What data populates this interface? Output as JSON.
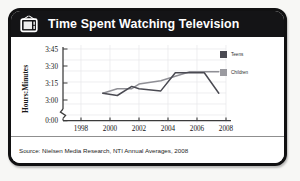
{
  "card": {
    "title": "Time Spent Watching Television",
    "icon": "television-icon",
    "source": "Source: Nielsen Media Research, NTI Annual Averages, 2008",
    "border_color": "#141416",
    "header_bg": "#141416",
    "body_bg": "#ffffff"
  },
  "chart_data": {
    "type": "line",
    "title": "Time Spent Watching Television",
    "xlabel": "",
    "ylabel": "Hours:Minutes",
    "xlim": [
      1998,
      2008
    ],
    "ylim": [
      180,
      225
    ],
    "xticks": [
      "1998",
      "2000",
      "2002",
      "2004",
      "2006",
      "2008"
    ],
    "xtick_values": [
      1998,
      2000,
      2002,
      2004,
      2006,
      2008
    ],
    "yticks": [
      "0:00",
      "3:00",
      "3:15",
      "3:30",
      "3:45"
    ],
    "ytick_values": [
      0,
      180,
      195,
      210,
      225
    ],
    "axis_break": true,
    "grid": true,
    "legend_position": "right",
    "series": [
      {
        "name": "Teens",
        "color": "#4a4a52",
        "x": [
          1999.5,
          2000.5,
          2001.5,
          2002.0,
          2003.5,
          2004.5,
          2005.5,
          2006.5,
          2007.5
        ],
        "y": [
          186,
          184,
          192,
          190,
          188,
          204,
          204,
          204,
          186
        ],
        "y_labels": [
          "3:06",
          "3:04",
          "3:12",
          "3:10",
          "3:08",
          "3:24",
          "3:24",
          "3:24",
          "3:06"
        ]
      },
      {
        "name": "Children",
        "color": "#8f8f95",
        "x": [
          1999.5,
          2000.5,
          2001.5,
          2002.0,
          2003.5,
          2004.5,
          2005.5,
          2006.5,
          2007.5
        ],
        "y": [
          186,
          190,
          190,
          194,
          197,
          201,
          205,
          205,
          205
        ],
        "y_labels": [
          "3:06",
          "3:10",
          "3:10",
          "3:14",
          "3:17",
          "3:21",
          "3:25",
          "3:25",
          "3:25"
        ]
      }
    ]
  },
  "legend": {
    "items": [
      {
        "label": "Teens",
        "color": "#4a4a52"
      },
      {
        "label": "Children",
        "color": "#9a9aa0"
      }
    ]
  }
}
